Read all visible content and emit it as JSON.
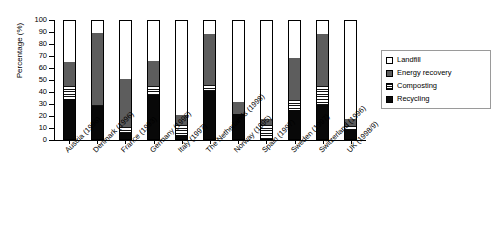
{
  "chart_data": {
    "type": "bar",
    "subtype": "stacked-bar",
    "title": "",
    "xlabel": "",
    "ylabel": "Percentage (%)",
    "ylim": [
      0,
      100
    ],
    "ytick_step": 10,
    "yticks": [
      "0",
      "10",
      "20",
      "30",
      "40",
      "50",
      "60",
      "70",
      "80",
      "90",
      "100"
    ],
    "grid": false,
    "legend_position": "right",
    "categories": [
      "Austria (1996)",
      "Denmark (1996)",
      "France (1993)",
      "Germany (1996)",
      "Italy (1997)",
      "The Netherlands (1998)",
      "Norway (1995)",
      "Spain (1997)",
      "Sweden (1997)",
      "Switzerland (1996)",
      "UK (1998/9)"
    ],
    "series": [
      {
        "name": "Recycling",
        "color": "#080808",
        "values": [
          34,
          28,
          5,
          37,
          3,
          41,
          21,
          0,
          25,
          29,
          8
        ]
      },
      {
        "name": "Composting",
        "color": "#ffffff",
        "pattern": "horizontal-stripes",
        "values": [
          11,
          1,
          5,
          8,
          9,
          5,
          0,
          12,
          8,
          16,
          3
        ]
      },
      {
        "name": "Energy recovery",
        "color": "#5d5d5d",
        "values": [
          20,
          61,
          41,
          21,
          8,
          43,
          10,
          5,
          36,
          44,
          6
        ]
      },
      {
        "name": "Landfill",
        "color": "#ffffff",
        "values": [
          35,
          10,
          49,
          34,
          80,
          11,
          69,
          83,
          31,
          11,
          83
        ]
      }
    ],
    "cumulative_tops": {
      "Recycling": [
        34,
        28,
        5,
        37,
        3,
        41,
        21,
        0,
        25,
        29,
        8
      ],
      "Composting": [
        45,
        29,
        10,
        45,
        12,
        46,
        21,
        12,
        33,
        45,
        11
      ],
      "Energy recovery": [
        65,
        90,
        51,
        66,
        20,
        89,
        31,
        17,
        69,
        89,
        17
      ],
      "Landfill": [
        100,
        100,
        100,
        100,
        100,
        100,
        100,
        100,
        100,
        100,
        100
      ]
    }
  },
  "legend": {
    "items": [
      {
        "label": "Landfill",
        "swatch": "sw-landfill"
      },
      {
        "label": "Energy recovery",
        "swatch": "sw-energy"
      },
      {
        "label": "Composting",
        "swatch": "sw-composting"
      },
      {
        "label": "Recycling",
        "swatch": "sw-recycling"
      }
    ]
  }
}
